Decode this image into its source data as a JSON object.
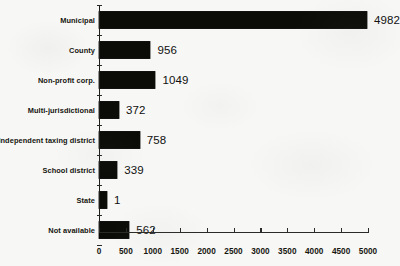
{
  "chart_data": {
    "type": "bar",
    "orientation": "horizontal",
    "title": "",
    "xlabel": "",
    "ylabel": "",
    "categories": [
      "Municipal",
      "County",
      "Non-profit corp.",
      "Multi-jurisdictional",
      "Independent taxing district",
      "School district",
      "State",
      "Not available"
    ],
    "values": [
      4982,
      956,
      1049,
      372,
      758,
      339,
      1,
      562
    ],
    "value_labels": [
      "4982",
      "956",
      "1049",
      "372",
      "758",
      "339",
      "1",
      "562"
    ],
    "xlim": [
      0,
      5000
    ],
    "xticks": [
      0,
      500,
      1000,
      1500,
      2000,
      2500,
      3000,
      3500,
      4000,
      4500,
      5000
    ],
    "xtick_labels": [
      "0",
      "500",
      "1000",
      "1500",
      "2000",
      "2500",
      "3000",
      "3500",
      "4000",
      "4500",
      "5000"
    ],
    "grid": false,
    "legend": false,
    "bar_color": "#0b0b08",
    "background_color": "#f7f7f5",
    "axis_color": "#2a2a26"
  }
}
